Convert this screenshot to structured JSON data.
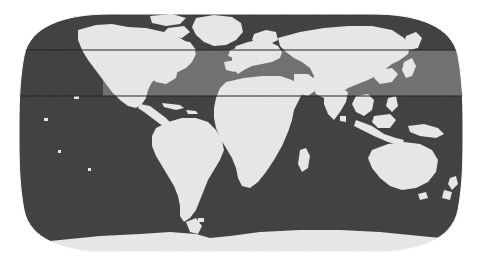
{
  "figure": {
    "type": "world-map",
    "title": "",
    "projection": "robinson",
    "caption": "",
    "width": 482,
    "height": 266
  },
  "colors": {
    "background": "#ffffff",
    "ocean": "#3b3b3b",
    "ocean_highlight": "#707070",
    "land": "#f2f2f0",
    "land_outline": "#2a2a2a",
    "band_line": "#1a1a1a",
    "graticule": "#4a4a4a"
  },
  "map_extent": {
    "left_px": 21,
    "right_px": 461,
    "top_px": 14,
    "bottom_px": 252,
    "center_x_px": 241,
    "center_y_px": 133
  },
  "highlight_band": {
    "label": "",
    "top_y_px": 50,
    "bottom_y_px": 96,
    "start_x_px": 103,
    "end_x_px": 461,
    "approx_lat_north": 55,
    "approx_lat_south": 23,
    "fill": "#707070",
    "edge_line_color": "#1a1a1a",
    "edge_line_width_px": 1
  },
  "chart_data": {
    "type": "map",
    "title": "",
    "xlabel": "",
    "ylabel": "",
    "legend": [],
    "annotations": [
      {
        "name": "northern-latitude-band",
        "kind": "horizontal-band",
        "lat_top": 55,
        "lat_bottom": 23,
        "lon_start": -70,
        "lon_end": 180
      }
    ],
    "regions": [
      {
        "name": "North America",
        "visible": true
      },
      {
        "name": "South America",
        "visible": true
      },
      {
        "name": "Europe",
        "visible": true
      },
      {
        "name": "Africa",
        "visible": true
      },
      {
        "name": "Asia",
        "visible": true
      },
      {
        "name": "Australia",
        "visible": true
      },
      {
        "name": "Antarctica",
        "visible": true
      },
      {
        "name": "Greenland",
        "visible": true
      }
    ]
  },
  "accessibility": {
    "alt": "Grayscale world map in a rounded Robinson-style projection with a lighter horizontal band across the northern mid-latitudes"
  }
}
